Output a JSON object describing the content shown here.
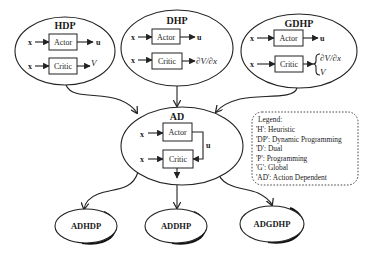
{
  "diagram": {
    "top_modules": [
      {
        "id": "hdp",
        "title": "HDP",
        "actor": {
          "label": "Actor",
          "input": "x",
          "output": "u"
        },
        "critic": {
          "label": "Critic",
          "input": "x",
          "output": "V"
        }
      },
      {
        "id": "dhp",
        "title": "DHP",
        "actor": {
          "label": "Actor",
          "input": "x",
          "output": "u"
        },
        "critic": {
          "label": "Critic",
          "input": "x",
          "output": "∂V/∂x"
        }
      },
      {
        "id": "gdhp",
        "title": "GDHP",
        "actor": {
          "label": "Actor",
          "input": "x",
          "output": "u"
        },
        "critic": {
          "label": "Critic",
          "input": "x",
          "output_line1": "∂V/∂x",
          "output_line2": "V",
          "brace": "{"
        }
      }
    ],
    "center_module": {
      "id": "ad",
      "title": "AD",
      "actor": {
        "label": "Actor",
        "input": "x"
      },
      "critic": {
        "label": "Critic",
        "input": "x"
      },
      "feedback_label": "u"
    },
    "bottom_modules": [
      {
        "id": "adhdp",
        "title": "ADHDP"
      },
      {
        "id": "addhp",
        "title": "ADDHP"
      },
      {
        "id": "adgdhp",
        "title": "ADGDHP"
      }
    ],
    "legend": {
      "heading": "Legend:",
      "entries": [
        "'H': Heuristic",
        "'DP': Dynamic Programming",
        "'D': Dual",
        "'P': Programming",
        "'G': Global",
        "'AD': Action Dependent"
      ]
    }
  }
}
